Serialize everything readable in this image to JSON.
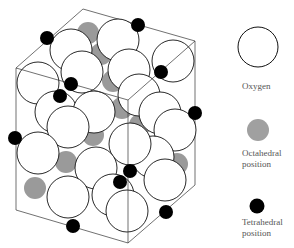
{
  "colors": {
    "oxygen_fill": "#ffffff",
    "oxygen_stroke": "#111111",
    "octahedral": "#9a9a9a",
    "tetrahedral": "#000000",
    "box_stroke": "#333333"
  },
  "legend": {
    "oxygen": {
      "label": "Oxygen",
      "icon": "white-circle"
    },
    "octahedral": {
      "label_line1": "Octahedral",
      "label_line2": "position",
      "icon": "gray-circle"
    },
    "tetrahedral": {
      "label_line1": "Tetrahedral",
      "label_line2": "position",
      "icon": "black-circle"
    }
  }
}
